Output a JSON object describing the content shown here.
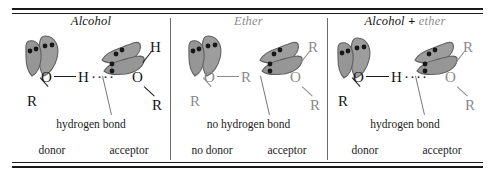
{
  "figure": {
    "name": "hydrogen-bonding-alcohol-ether-comparison",
    "width": 495,
    "height": 178,
    "colors": {
      "rule": "#1a1a1a",
      "divider": "#6b6b6b",
      "black_text": "#141414",
      "gray_text": "#8a8a8a",
      "lobe_fill": "#9a9a9a",
      "lobe_stroke": "#5c5c5c",
      "lone_pair_dot": "#171717",
      "leader_line": "#7a7a7a"
    }
  },
  "panels": [
    {
      "id": "alcohol",
      "title_parts": [
        {
          "text": "Alcohol",
          "style": "black-italic"
        }
      ],
      "title_plain": "Alcohol",
      "donor": {
        "center_atom": "O",
        "substituent": "R",
        "hydrogen": "H",
        "color": "black",
        "lone_pairs": 2,
        "lobes": 2
      },
      "acceptor": {
        "center_atom": "O",
        "substituent": "R",
        "hydrogen": "H",
        "color": "black",
        "lone_pairs": 2,
        "lobes": 2
      },
      "bond_present": true,
      "bond_symbol": "····",
      "bond_caption": "hydrogen bond",
      "role_left": "donor",
      "role_right": "acceptor"
    },
    {
      "id": "ether",
      "title_parts": [
        {
          "text": "Ether",
          "style": "gray-italic"
        }
      ],
      "title_plain": "Ether",
      "donor": {
        "center_atom": "O",
        "substituent": "R",
        "hydrogen": "R",
        "color": "gray",
        "lone_pairs": 2,
        "lobes": 2
      },
      "acceptor": {
        "center_atom": "O",
        "substituent": "R",
        "hydrogen": "R",
        "color": "gray",
        "lone_pairs": 2,
        "lobes": 2
      },
      "bond_present": false,
      "bond_symbol": "",
      "bond_caption": "no hydrogen bond",
      "role_left": "no donor",
      "role_right": "acceptor"
    },
    {
      "id": "alcohol-plus-ether",
      "title_parts": [
        {
          "text": "Alcohol",
          "style": "black-italic"
        },
        {
          "text": "+",
          "style": "black-bold"
        },
        {
          "text": "ether",
          "style": "gray-italic"
        }
      ],
      "title_plain": "Alcohol + ether",
      "donor": {
        "center_atom": "O",
        "substituent": "R",
        "hydrogen": "H",
        "color": "black",
        "lone_pairs": 2,
        "lobes": 2
      },
      "acceptor": {
        "center_atom": "O",
        "substituent": "R",
        "hydrogen": "R",
        "color": "gray",
        "lone_pairs": 2,
        "lobes": 2
      },
      "bond_present": true,
      "bond_symbol": "····",
      "bond_caption": "hydrogen bond",
      "role_left": "donor",
      "role_right": "acceptor"
    }
  ]
}
